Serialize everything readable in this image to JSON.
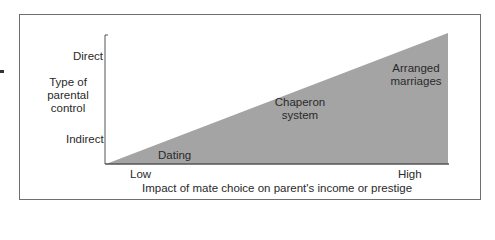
{
  "diagram": {
    "y_axis": {
      "title_lines": [
        "Type of",
        "parental",
        "control"
      ],
      "top_label": "Direct",
      "bottom_label": "Indirect"
    },
    "x_axis": {
      "title": "Impact of mate choice on parent's income or prestige",
      "low_label": "Low",
      "high_label": "High"
    },
    "regions": [
      {
        "name": "dating",
        "lines": [
          "Dating"
        ]
      },
      {
        "name": "chaperon-system",
        "lines": [
          "Chaperon",
          "system"
        ]
      },
      {
        "name": "arranged-marriages",
        "lines": [
          "Arranged",
          "marriages"
        ]
      }
    ],
    "colors": {
      "fill": "#a4a4a4",
      "axis": "#555555",
      "frame": "#6e6e6e"
    }
  }
}
